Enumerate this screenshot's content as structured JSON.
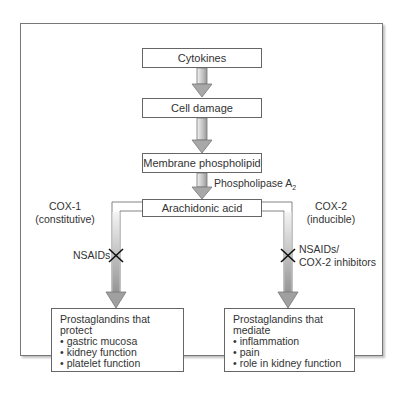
{
  "diagram": {
    "type": "flowchart",
    "nodes": {
      "cytokines": "Cytokines",
      "cell_damage": "Cell damage",
      "membrane_phospholipid": "Membrane phospholipid",
      "arachidonic_acid": "Arachidonic acid"
    },
    "edges": {
      "phospholipase_label": "Phospholipase A",
      "phospholipase_subscript": "2",
      "cox1_name": "COX-1",
      "cox1_type": "(constitutive)",
      "cox2_name": "COX-2",
      "cox2_type": "(inducible)",
      "left_inhibitor": "NSAIDs",
      "right_inhibitor_line1": "NSAIDs/",
      "right_inhibitor_line2": "COX-2 inhibitors",
      "block_symbol": "X"
    },
    "outcomes": {
      "left": {
        "heading": "Prostaglandins that protect",
        "items": [
          "gastric mucosa",
          "kidney function",
          "platelet function"
        ]
      },
      "right": {
        "heading": "Prostaglandins that mediate",
        "items": [
          "inflammation",
          "pain",
          "role in kidney function"
        ]
      }
    },
    "colors": {
      "arrow_fill_light": "#e6e6e6",
      "arrow_fill_dark": "#8c8c8c",
      "border": "#666666",
      "text": "#333333"
    }
  }
}
